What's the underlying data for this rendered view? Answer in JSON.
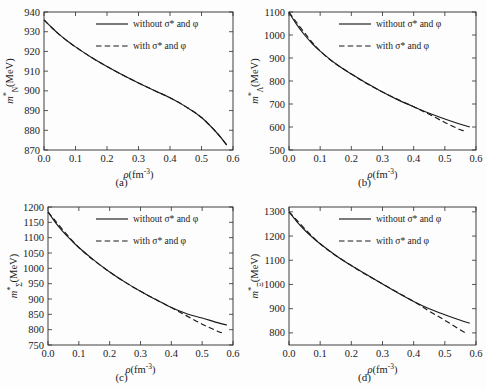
{
  "figure": {
    "panel_count": 4,
    "background_color": "#fdfdfd",
    "line_color": "#1a1a1a"
  },
  "legend": {
    "solid_label": "without σ* and φ",
    "dashed_label": "with σ*  and φ"
  },
  "captions": {
    "a": "(a)",
    "b": "(b)",
    "c": "(c)",
    "d": "(d)"
  },
  "axis": {
    "xlabel_symbol": "ρ",
    "xlabel_unit": "(fm",
    "xlabel_exponent": "-3",
    "xlabel_close": ")",
    "ylabel_prefix": "m",
    "ylabel_star": "*",
    "ylabel_unit": "(MeV)"
  },
  "chart_data": [
    {
      "type": "line",
      "panel": "a",
      "title": "(a)",
      "xlabel": "ρ(fm-3)",
      "ylabel": "m*N(MeV)",
      "ylabel_subscript": "N",
      "xlim": [
        0.0,
        0.6
      ],
      "ylim": [
        870,
        940
      ],
      "xticks": [
        "0.0",
        "0.1",
        "0.2",
        "0.3",
        "0.4",
        "0.5",
        "0.6"
      ],
      "xtick_values": [
        0.0,
        0.1,
        0.2,
        0.3,
        0.4,
        0.5,
        0.6
      ],
      "yticks": [
        "870",
        "880",
        "890",
        "900",
        "910",
        "920",
        "930",
        "940"
      ],
      "ytick_values": [
        870,
        880,
        890,
        900,
        910,
        920,
        930,
        940
      ],
      "grid": false,
      "legend_position": "upper-right",
      "series": [
        {
          "name": "without σ* and φ",
          "style": "solid",
          "x": [
            0.0,
            0.025,
            0.05,
            0.075,
            0.1,
            0.15,
            0.2,
            0.25,
            0.3,
            0.35,
            0.4,
            0.45,
            0.5,
            0.55,
            0.58
          ],
          "values": [
            936.0,
            932.0,
            928.4,
            925.2,
            922.3,
            917.0,
            912.3,
            908.0,
            904.0,
            900.2,
            896.5,
            892.0,
            886.5,
            878.5,
            872.5
          ]
        },
        {
          "name": "with σ* and φ",
          "style": "dashed",
          "x": [
            0.0,
            0.025,
            0.05,
            0.075,
            0.1,
            0.15,
            0.2,
            0.25,
            0.3,
            0.35,
            0.4,
            0.45,
            0.5,
            0.55,
            0.58
          ],
          "values": [
            936.0,
            932.0,
            928.4,
            925.2,
            922.3,
            917.0,
            912.3,
            908.0,
            904.0,
            900.2,
            896.5,
            892.0,
            886.5,
            878.5,
            872.5
          ]
        }
      ]
    },
    {
      "type": "line",
      "panel": "b",
      "title": "(b)",
      "xlabel": "ρ(fm-3)",
      "ylabel": "m*Λ(MeV)",
      "ylabel_subscript": "Λ",
      "xlim": [
        0.0,
        0.6
      ],
      "ylim": [
        500,
        1100
      ],
      "xticks": [
        "0.0",
        "0.1",
        "0.2",
        "0.3",
        "0.4",
        "0.5",
        "0.6"
      ],
      "xtick_values": [
        0.0,
        0.1,
        0.2,
        0.3,
        0.4,
        0.5,
        0.6
      ],
      "yticks": [
        "500",
        "600",
        "700",
        "800",
        "900",
        "1000",
        "1100"
      ],
      "ytick_values": [
        500,
        600,
        700,
        800,
        900,
        1000,
        1100
      ],
      "grid": false,
      "legend_position": "upper-right",
      "series": [
        {
          "name": "without σ* and φ",
          "style": "solid",
          "x": [
            0.0,
            0.025,
            0.05,
            0.075,
            0.1,
            0.15,
            0.2,
            0.25,
            0.3,
            0.35,
            0.4,
            0.45,
            0.5,
            0.55,
            0.58
          ],
          "values": [
            1098,
            1045,
            1000,
            962,
            930,
            875,
            830,
            790,
            752,
            718,
            688,
            660,
            635,
            612,
            600
          ]
        },
        {
          "name": "with σ* and φ",
          "style": "dashed",
          "x": [
            0.0,
            0.1,
            0.2,
            0.3,
            0.4,
            0.45,
            0.5,
            0.55,
            0.57
          ],
          "values": [
            1098,
            930,
            830,
            752,
            688,
            655,
            620,
            588,
            582
          ]
        }
      ]
    },
    {
      "type": "line",
      "panel": "c",
      "title": "(c)",
      "xlabel": "ρ(fm-3)",
      "ylabel": "m*Σ(MeV)",
      "ylabel_subscript": "Σ",
      "xlim": [
        0.0,
        0.6
      ],
      "ylim": [
        750,
        1200
      ],
      "xticks": [
        "0.0",
        "0.1",
        "0.2",
        "0.3",
        "0.4",
        "0.5",
        "0.6"
      ],
      "xtick_values": [
        0.0,
        0.1,
        0.2,
        0.3,
        0.4,
        0.5,
        0.6
      ],
      "yticks": [
        "750",
        "800",
        "850",
        "900",
        "950",
        "1000",
        "1050",
        "1100",
        "1150",
        "1200"
      ],
      "ytick_values": [
        750,
        800,
        850,
        900,
        950,
        1000,
        1050,
        1100,
        1150,
        1200
      ],
      "grid": false,
      "legend_position": "upper-right",
      "series": [
        {
          "name": "without σ* and φ",
          "style": "solid",
          "x": [
            0.0,
            0.025,
            0.05,
            0.075,
            0.1,
            0.15,
            0.2,
            0.25,
            0.3,
            0.35,
            0.4,
            0.45,
            0.5,
            0.55,
            0.58
          ],
          "values": [
            1184,
            1148,
            1118,
            1092,
            1068,
            1026,
            988,
            955,
            925,
            898,
            872,
            852,
            838,
            823,
            815
          ]
        },
        {
          "name": "with σ* and φ",
          "style": "dashed",
          "x": [
            0.0,
            0.1,
            0.2,
            0.3,
            0.4,
            0.45,
            0.5,
            0.55,
            0.57
          ],
          "values": [
            1184,
            1068,
            988,
            925,
            872,
            845,
            818,
            795,
            788
          ]
        }
      ]
    },
    {
      "type": "line",
      "panel": "d",
      "title": "(d)",
      "xlabel": "ρ(fm-3)",
      "ylabel": "m*Ξ(MeV)",
      "ylabel_subscript": "Ξ",
      "xlim": [
        0.0,
        0.6
      ],
      "ylim": [
        750,
        1320
      ],
      "xticks": [
        "0.0",
        "0.1",
        "0.2",
        "0.3",
        "0.4",
        "0.5",
        "0.6"
      ],
      "xtick_values": [
        0.0,
        0.1,
        0.2,
        0.3,
        0.4,
        0.5,
        0.6
      ],
      "yticks": [
        "800",
        "900",
        "1000",
        "1100",
        "1200",
        "1300"
      ],
      "ytick_values": [
        800,
        900,
        1000,
        1100,
        1200,
        1300
      ],
      "grid": false,
      "legend_position": "upper-right",
      "series": [
        {
          "name": "without σ* and φ",
          "style": "solid",
          "x": [
            0.0,
            0.025,
            0.05,
            0.075,
            0.1,
            0.15,
            0.2,
            0.25,
            0.3,
            0.35,
            0.4,
            0.45,
            0.5,
            0.55,
            0.58
          ],
          "values": [
            1300,
            1260,
            1225,
            1195,
            1168,
            1120,
            1078,
            1040,
            1002,
            965,
            930,
            900,
            875,
            852,
            840
          ]
        },
        {
          "name": "with σ* and φ",
          "style": "dashed",
          "x": [
            0.0,
            0.1,
            0.2,
            0.3,
            0.4,
            0.45,
            0.5,
            0.55,
            0.57
          ],
          "values": [
            1300,
            1168,
            1078,
            1002,
            930,
            890,
            852,
            812,
            798
          ]
        }
      ]
    }
  ]
}
